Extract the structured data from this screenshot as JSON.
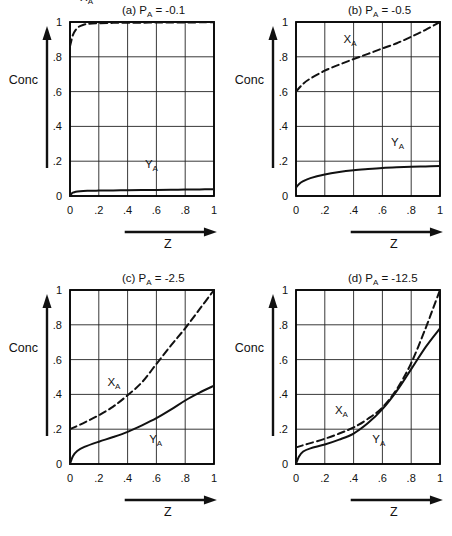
{
  "figure": {
    "axis_labels": {
      "y": "Conc",
      "x": "Z"
    },
    "x_ticks": [
      "0",
      ".2",
      ".4",
      ".6",
      ".8",
      "1"
    ],
    "y_ticks": [
      "0",
      ".2",
      ".4",
      ".6",
      ".8",
      "1"
    ],
    "x_tick_values": [
      0,
      0.2,
      0.4,
      0.6,
      0.8,
      1
    ],
    "y_tick_values": [
      0,
      0.2,
      0.4,
      0.6,
      0.8,
      1
    ],
    "series_labels": {
      "x_a": "X",
      "y_a": "Y",
      "subscript": "A"
    },
    "colors": {
      "ink": "#111111",
      "grid": "#222222",
      "frame": "#000000"
    }
  },
  "chart_data": [
    {
      "type": "line",
      "panel": "a",
      "title": "(a) Pₐ = -0.1",
      "title_prefix": "(a) P",
      "title_sub": "A",
      "title_suffix": " = -0.1",
      "xlabel": "Z",
      "ylabel": "Conc",
      "xlim": [
        0,
        1
      ],
      "ylim": [
        0,
        1
      ],
      "grid": true,
      "legend": "inline-labels",
      "label_positions": {
        "X_A": {
          "x": 0.07,
          "y": 1.12
        },
        "Y_A": {
          "x": 0.52,
          "y": 0.16
        }
      },
      "series": [
        {
          "name": "X_A",
          "style": "dashed",
          "x": [
            0,
            0.02,
            0.04,
            0.06,
            0.09,
            0.13,
            0.2,
            0.3,
            0.4,
            0.5,
            0.6,
            0.7,
            0.8,
            0.9,
            1
          ],
          "values": [
            0.86,
            0.925,
            0.955,
            0.972,
            0.983,
            0.99,
            0.993,
            0.995,
            0.996,
            0.996,
            0.997,
            0.997,
            0.997,
            0.998,
            0.998
          ]
        },
        {
          "name": "Y_A",
          "style": "solid",
          "x": [
            0,
            0.01,
            0.02,
            0.04,
            0.07,
            0.12,
            0.2,
            0.3,
            0.4,
            0.5,
            0.6,
            0.7,
            0.8,
            0.9,
            1
          ],
          "values": [
            0.0,
            0.012,
            0.019,
            0.025,
            0.028,
            0.03,
            0.031,
            0.032,
            0.033,
            0.034,
            0.035,
            0.036,
            0.037,
            0.038,
            0.039
          ]
        }
      ]
    },
    {
      "type": "line",
      "panel": "b",
      "title": "(b) Pₐ = -0.5",
      "title_prefix": "(b) P",
      "title_sub": "A",
      "title_suffix": " = -0.5",
      "xlabel": "Z",
      "ylabel": "Conc",
      "xlim": [
        0,
        1
      ],
      "ylim": [
        0,
        1
      ],
      "grid": true,
      "legend": "inline-labels",
      "label_positions": {
        "X_A": {
          "x": 0.33,
          "y": 0.88
        },
        "Y_A": {
          "x": 0.66,
          "y": 0.29
        }
      },
      "series": [
        {
          "name": "X_A",
          "style": "dashed",
          "x": [
            0,
            0.05,
            0.1,
            0.2,
            0.3,
            0.4,
            0.5,
            0.6,
            0.7,
            0.8,
            0.9,
            1
          ],
          "values": [
            0.6,
            0.645,
            0.675,
            0.72,
            0.755,
            0.787,
            0.817,
            0.848,
            0.878,
            0.915,
            0.955,
            1.0
          ]
        },
        {
          "name": "Y_A",
          "style": "solid",
          "x": [
            0,
            0.02,
            0.05,
            0.1,
            0.2,
            0.3,
            0.4,
            0.5,
            0.6,
            0.7,
            0.8,
            0.9,
            1
          ],
          "values": [
            0.048,
            0.068,
            0.085,
            0.103,
            0.124,
            0.138,
            0.148,
            0.155,
            0.161,
            0.165,
            0.168,
            0.17,
            0.172
          ]
        }
      ]
    },
    {
      "type": "line",
      "panel": "c",
      "title": "(c) Pₐ = -2.5",
      "title_prefix": "(c) P",
      "title_sub": "A",
      "title_suffix": " = -2.5",
      "xlabel": "Z",
      "ylabel": "Conc",
      "xlim": [
        0,
        1
      ],
      "ylim": [
        0,
        1
      ],
      "grid": true,
      "legend": "inline-labels",
      "label_positions": {
        "X_A": {
          "x": 0.26,
          "y": 0.45
        },
        "Y_A": {
          "x": 0.55,
          "y": 0.12
        }
      },
      "series": [
        {
          "name": "X_A",
          "style": "dashed",
          "x": [
            0,
            0.1,
            0.2,
            0.3,
            0.4,
            0.5,
            0.6,
            0.7,
            0.8,
            0.9,
            1
          ],
          "values": [
            0.2,
            0.238,
            0.28,
            0.33,
            0.395,
            0.47,
            0.575,
            0.68,
            0.78,
            0.89,
            1.0
          ]
        },
        {
          "name": "Y_A",
          "style": "solid",
          "x": [
            0,
            0.02,
            0.05,
            0.1,
            0.2,
            0.3,
            0.4,
            0.5,
            0.6,
            0.7,
            0.8,
            0.9,
            1
          ],
          "values": [
            0.0,
            0.045,
            0.075,
            0.098,
            0.128,
            0.155,
            0.185,
            0.222,
            0.263,
            0.312,
            0.365,
            0.41,
            0.45
          ]
        }
      ]
    },
    {
      "type": "line",
      "panel": "d",
      "title": "(d) Pₐ = -12.5",
      "title_prefix": "(d) P",
      "title_sub": "A",
      "title_suffix": " = -12.5",
      "xlabel": "Z",
      "ylabel": "Conc",
      "xlim": [
        0,
        1
      ],
      "ylim": [
        0,
        1
      ],
      "grid": true,
      "legend": "inline-labels",
      "label_positions": {
        "X_A": {
          "x": 0.27,
          "y": 0.29
        },
        "Y_A": {
          "x": 0.53,
          "y": 0.12
        }
      },
      "series": [
        {
          "name": "X_A",
          "style": "dashed",
          "x": [
            0,
            0.05,
            0.1,
            0.2,
            0.3,
            0.4,
            0.5,
            0.6,
            0.7,
            0.8,
            0.9,
            0.95,
            1
          ],
          "values": [
            0.095,
            0.108,
            0.12,
            0.145,
            0.175,
            0.21,
            0.26,
            0.325,
            0.43,
            0.58,
            0.78,
            0.89,
            1.0
          ]
        },
        {
          "name": "Y_A",
          "style": "solid",
          "x": [
            0,
            0.02,
            0.05,
            0.1,
            0.2,
            0.3,
            0.4,
            0.5,
            0.6,
            0.7,
            0.8,
            0.9,
            1
          ],
          "values": [
            0.0,
            0.042,
            0.072,
            0.09,
            0.112,
            0.14,
            0.175,
            0.235,
            0.315,
            0.42,
            0.545,
            0.672,
            0.78
          ]
        }
      ]
    }
  ]
}
